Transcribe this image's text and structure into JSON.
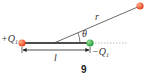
{
  "diagram": {
    "labels": {
      "positive_charge": "+Q",
      "positive_sub": "1",
      "negative_charge": "−Q",
      "negative_sub": "1",
      "distance": "r",
      "angle": "θ",
      "separation": "l",
      "figure_number": "9"
    },
    "colors": {
      "positive_charge": "#e8401c",
      "negative_charge": "#2ea043",
      "test_point": "#e8401c",
      "line": "#333333",
      "dotted_axis": "#999999"
    }
  }
}
